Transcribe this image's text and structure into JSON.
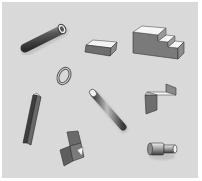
{
  "scene": {
    "description": "Illustration of assorted 3D geometric objects on a grey background",
    "background_color": "#d9d9d9",
    "border_color": "#ffffff",
    "objects": [
      {
        "name": "tube",
        "label": "Hollow tube (diagonal)"
      },
      {
        "name": "rectangular-block",
        "label": "Rectangular block"
      },
      {
        "name": "stair-block",
        "label": "Stepped block / staircase"
      },
      {
        "name": "ring",
        "label": "Ring / washer"
      },
      {
        "name": "square-bar",
        "label": "Square bar (vertical diagonal)"
      },
      {
        "name": "cylinder-rod",
        "label": "Solid rod (diagonal)"
      },
      {
        "name": "bent-plate",
        "label": "Bent angle plate"
      },
      {
        "name": "folded-sheet",
        "label": "Folded sheet with corner"
      },
      {
        "name": "stepped-shaft",
        "label": "Stepped cylindrical shaft"
      }
    ]
  }
}
